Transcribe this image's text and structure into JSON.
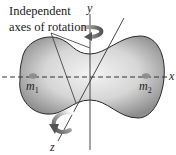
{
  "figure": {
    "caption_line1": "Independent",
    "caption_line2": "axes of rotation",
    "axes": {
      "x": "x",
      "y": "y",
      "z": "z"
    },
    "masses": [
      {
        "symbol": "m",
        "subscript": "1"
      },
      {
        "symbol": "m",
        "subscript": "2"
      }
    ],
    "icons": [
      "rotation-arrow-y",
      "rotation-arrow-z"
    ],
    "colors": {
      "body_light": "#f2f2f2",
      "body_dark": "#8a8a8a",
      "line": "#333333",
      "mass_dot": "#9a9a9a"
    }
  }
}
